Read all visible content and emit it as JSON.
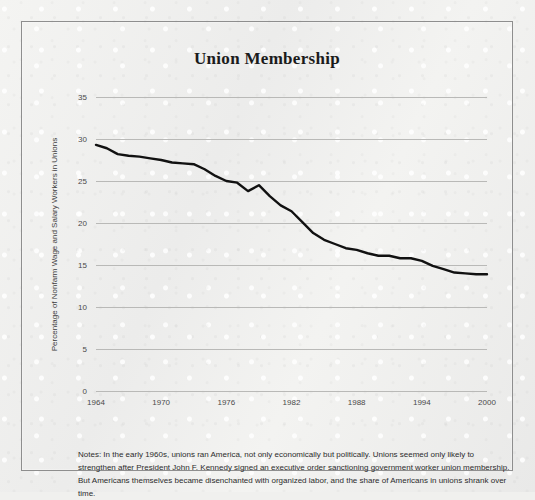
{
  "figure": {
    "title": "Union Membership",
    "notes": "Notes: In the early 1960s, unions ran America, not only economically but politically. Unions seemed only likely to strengthen after President John F. Kennedy signed an executive order sanctioning government worker union membership. But Americans themselves became disenchanted with organized labor, and the share of Americans in unions shrank over time.",
    "line_color": "#111111",
    "grid_color": "#b9b9b7",
    "background_color": "#f0f0ee",
    "border_color": "#8e8e8e"
  },
  "chart_data": {
    "type": "line",
    "title": "Union Membership",
    "xlabel": "",
    "ylabel": "Percentage of Nonfarm Wage and Salary Workers in Unions",
    "xlim": [
      1964,
      2000
    ],
    "ylim": [
      0,
      35
    ],
    "grid": true,
    "legend": false,
    "y_ticks": [
      0,
      5,
      10,
      15,
      20,
      25,
      30,
      35
    ],
    "x_ticks": [
      1964,
      1970,
      1976,
      1982,
      1988,
      1994,
      2000
    ],
    "x": [
      1964,
      1965,
      1966,
      1967,
      1968,
      1969,
      1970,
      1971,
      1972,
      1973,
      1974,
      1975,
      1976,
      1977,
      1978,
      1979,
      1980,
      1981,
      1982,
      1983,
      1984,
      1985,
      1986,
      1987,
      1988,
      1989,
      1990,
      1991,
      1992,
      1993,
      1994,
      1995,
      1996,
      1997,
      1998,
      1999,
      2000
    ],
    "values": [
      29.3,
      28.9,
      28.2,
      28.0,
      27.9,
      27.7,
      27.5,
      27.2,
      27.1,
      27.0,
      26.4,
      25.6,
      25.0,
      24.8,
      23.8,
      24.5,
      23.2,
      22.1,
      21.4,
      20.1,
      18.8,
      18.0,
      17.5,
      17.0,
      16.8,
      16.4,
      16.1,
      16.1,
      15.8,
      15.8,
      15.5,
      14.9,
      14.5,
      14.1,
      14.0,
      13.9,
      13.9
    ],
    "series_name": "Union membership rate"
  }
}
